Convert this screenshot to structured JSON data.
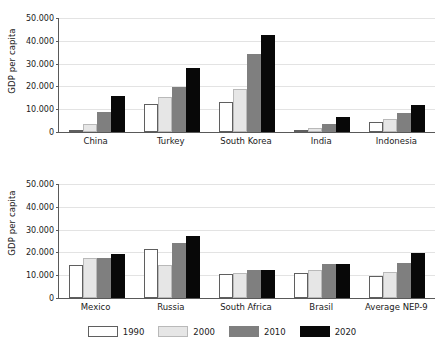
{
  "colors": {
    "y1990": "#ffffff",
    "y2000": "#e6e6e6",
    "y2010": "#7f7f7f",
    "y2020": "#080808",
    "axis": "#595959",
    "gridline": "#e3e3e3",
    "text": "#1a1a1a"
  },
  "legend": {
    "position": "bottom-center",
    "items": [
      {
        "label": "1990",
        "key": "y1990"
      },
      {
        "label": "2000",
        "key": "y2000"
      },
      {
        "label": "2010",
        "key": "y2010"
      },
      {
        "label": "2020",
        "key": "y2020"
      }
    ]
  },
  "panels": [
    {
      "id": "top",
      "ylabel": "GDP per capita",
      "yticks": [
        "0",
        "10.000",
        "20.000",
        "30.000",
        "40.000",
        "50.000"
      ],
      "categories": [
        "China",
        "Turkey",
        "South Korea",
        "India",
        "Indonesia"
      ]
    },
    {
      "id": "bottom",
      "ylabel": "GDP per capita",
      "yticks": [
        "0",
        "10.000",
        "20.000",
        "30.000",
        "40.000",
        "50.000"
      ],
      "categories": [
        "Mexico",
        "Russia",
        "South Africa",
        "Brasil",
        "Average NEP-9"
      ]
    }
  ],
  "chart_data": [
    {
      "type": "bar",
      "id": "top",
      "title": "",
      "xlabel": "",
      "ylabel": "GDP per capita",
      "ylim": [
        0,
        50000
      ],
      "ytick_values": [
        0,
        10000,
        20000,
        30000,
        40000,
        50000
      ],
      "ytick_labels": [
        "0",
        "10.000",
        "20.000",
        "30.000",
        "40.000",
        "50.000"
      ],
      "grid": true,
      "legend": "bottom",
      "categories": [
        "China",
        "Turkey",
        "South Korea",
        "India",
        "Indonesia"
      ],
      "series": [
        {
          "name": "1990",
          "values": [
            1100,
            12500,
            13000,
            1000,
            4300
          ]
        },
        {
          "name": "2000",
          "values": [
            3500,
            15400,
            18800,
            1700,
            5600
          ]
        },
        {
          "name": "2010",
          "values": [
            8800,
            19700,
            34000,
            3300,
            8500
          ]
        },
        {
          "name": "2020",
          "values": [
            16000,
            28000,
            42700,
            6500,
            11700
          ]
        }
      ]
    },
    {
      "type": "bar",
      "id": "bottom",
      "title": "",
      "xlabel": "",
      "ylabel": "GDP per capita",
      "ylim": [
        0,
        50000
      ],
      "ytick_values": [
        0,
        10000,
        20000,
        30000,
        40000,
        50000
      ],
      "ytick_labels": [
        "0",
        "10.000",
        "20.000",
        "30.000",
        "40.000",
        "50.000"
      ],
      "grid": true,
      "legend": "bottom",
      "categories": [
        "Mexico",
        "Russia",
        "South Africa",
        "Brasil",
        "Average NEP-9"
      ],
      "series": [
        {
          "name": "1990",
          "values": [
            14500,
            21500,
            10700,
            11100,
            9600
          ]
        },
        {
          "name": "2000",
          "values": [
            17600,
            14500,
            10800,
            12300,
            11400
          ]
        },
        {
          "name": "2010",
          "values": [
            17700,
            24200,
            12200,
            14800,
            15300
          ]
        },
        {
          "name": "2020",
          "values": [
            19500,
            27000,
            12200,
            14700,
            19900
          ]
        }
      ]
    }
  ]
}
